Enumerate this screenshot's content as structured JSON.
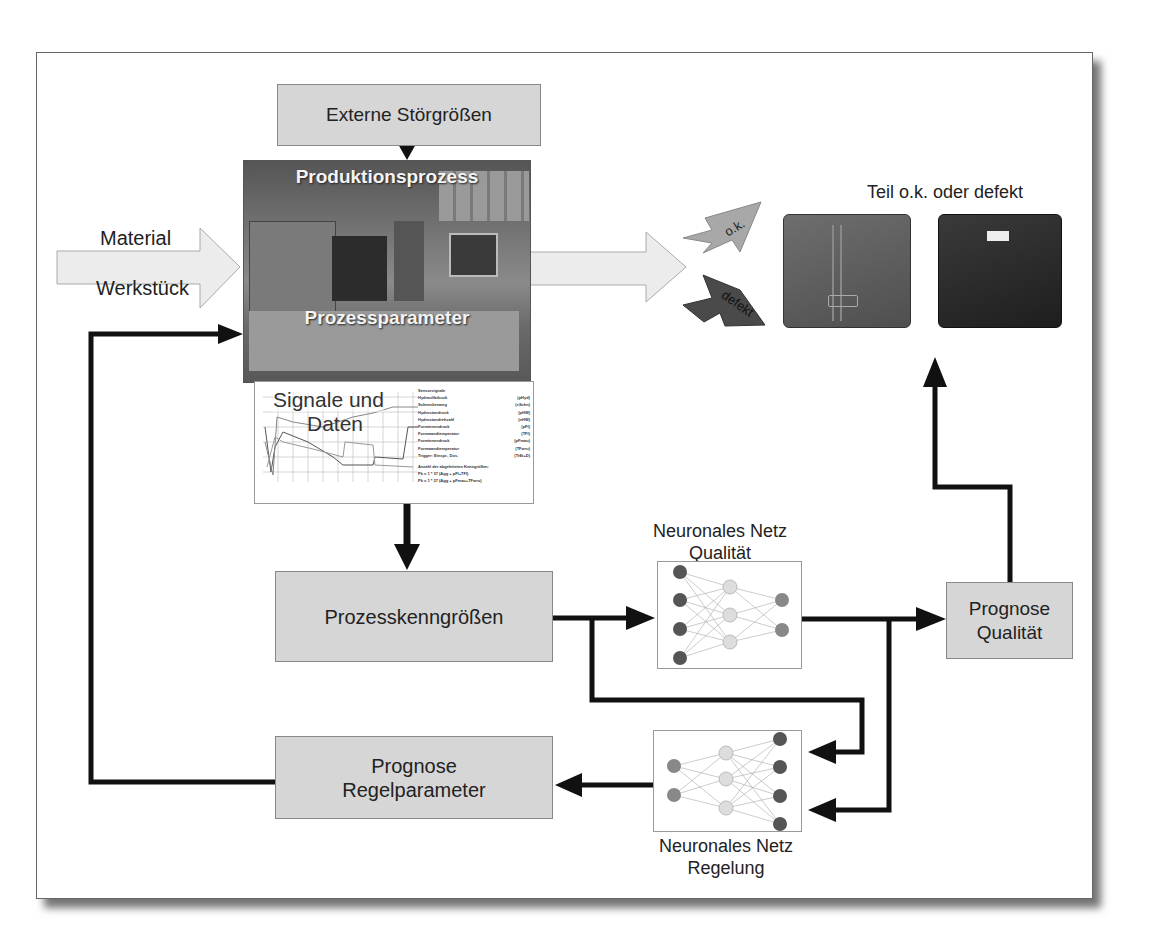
{
  "diagram": {
    "inputs": {
      "material": "Material",
      "werkstueck": "Werkstück"
    },
    "external": "Externe Störgrößen",
    "process_photo": {
      "top_label": "Produktionsprozess",
      "bottom_label": "Prozessparameter"
    },
    "signals": {
      "title_line1": "Signale und",
      "title_line2": "Daten",
      "legend": [
        {
          "name": "Sensorsignale",
          "code": ""
        },
        {
          "name": "Hydraulikdruck",
          "code": "(pHyd)"
        },
        {
          "name": "Schneckenweg",
          "code": "(sSchn)"
        },
        {
          "name": "Hydrostandruck",
          "code": "(pHW)"
        },
        {
          "name": "Hydrostandrehzahl",
          "code": "(nHW)"
        },
        {
          "name": "Forminnendruck",
          "code": "(pFI)"
        },
        {
          "name": "Formwandtemperatur",
          "code": "(TFI)"
        },
        {
          "name": "Forminnendruck",
          "code": "(pFmau)"
        },
        {
          "name": "Formwandtemperatur",
          "code": "(TFwru)"
        },
        {
          "name": "Trigger: Einspr., Dos.",
          "code": "(TrEt+D)"
        }
      ],
      "notes": [
        "Anzahl der abgeleiteten Kenngrößen:",
        "Pk = 1 * 37 (Agg + pFI+TFI)",
        "Pk = 1 * 37 (Agg + pFmau+TFwru)"
      ]
    },
    "outcome": {
      "title": "Teil o.k. oder defekt",
      "ok": "o.k.",
      "defekt": "defekt"
    },
    "kenngroessen": "Prozesskenngrößen",
    "nn_quality": {
      "line1": "Neuronales Netz",
      "line2": "Qualität"
    },
    "nn_control": {
      "line1": "Neuronales Netz",
      "line2": "Regelung"
    },
    "prognose_qualitaet": {
      "line1": "Prognose",
      "line2": "Qualität"
    },
    "prognose_regel": {
      "line1": "Prognose",
      "line2": "Regelparameter"
    },
    "colors": {
      "box_fill": "#d6d6d6",
      "arrow": "#111111",
      "ok_arrow": "#a8a8a8",
      "defekt_arrow": "#4a4a4a",
      "input_arrow": "#ececec"
    }
  }
}
